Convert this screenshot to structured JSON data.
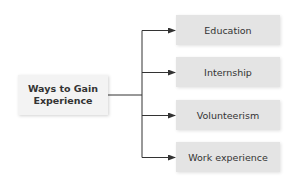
{
  "diagram": {
    "type": "tree",
    "root": {
      "label": "Ways to Gain Experience",
      "lines": [
        "Ways to Gain",
        "Experience"
      ]
    },
    "children": [
      {
        "label": "Education"
      },
      {
        "label": "Internship"
      },
      {
        "label": "Volunteerism"
      },
      {
        "label": "Work experience"
      }
    ],
    "colors": {
      "root_fill": "#f3f3f3",
      "child_fill": "#e4e4e4",
      "line": "#333333",
      "text": "#333333"
    }
  }
}
